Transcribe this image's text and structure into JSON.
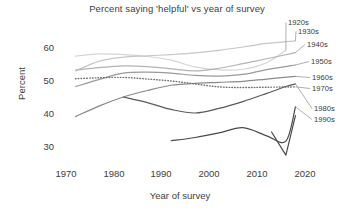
{
  "chart": {
    "title": "Percent saying 'helpful' vs year of survey",
    "xlabel": "Year of survey",
    "ylabel": "Percent"
  },
  "axes": {
    "yticks": [
      "60",
      "50",
      "40",
      "30"
    ],
    "xticks": [
      "1970",
      "1980",
      "1990",
      "2000",
      "2010",
      "2020"
    ]
  },
  "chart_data": {
    "type": "line",
    "title": "Percent saying 'helpful' vs year of survey",
    "xlabel": "Year of survey",
    "ylabel": "Percent",
    "xlim": [
      1968,
      2022
    ],
    "ylim": [
      26,
      63
    ],
    "grid": false,
    "legend": "right-inline-labels",
    "xticks": [
      1970,
      1980,
      1990,
      2000,
      2010,
      2020
    ],
    "yticks": [
      30,
      40,
      50,
      60
    ],
    "series": [
      {
        "name": "1920s",
        "color": "#d5d5d5",
        "style": "solid",
        "x": [
          1972,
          1977,
          1982,
          1987,
          1992,
          1997,
          2002,
          2007,
          2012,
          2016
        ],
        "values": [
          57.5,
          58.2,
          58.0,
          57.4,
          56.3,
          54.2,
          53.3,
          53.5,
          55.5,
          59.3
        ]
      },
      {
        "name": "1930s",
        "color": "#c6c6c6",
        "style": "solid",
        "x": [
          1972,
          1977,
          1982,
          1987,
          1992,
          1997,
          2002,
          2007,
          2012,
          2018
        ],
        "values": [
          53.0,
          56.0,
          57.2,
          57.6,
          58.0,
          58.5,
          59.3,
          60.3,
          61.4,
          62.2
        ]
      },
      {
        "name": "1940s",
        "color": "#b3b3b3",
        "style": "solid",
        "x": [
          1972,
          1977,
          1982,
          1987,
          1992,
          1997,
          2002,
          2007,
          2012,
          2018
        ],
        "values": [
          53.2,
          54.0,
          54.5,
          54.3,
          53.6,
          53.0,
          53.8,
          55.2,
          56.7,
          58.6
        ]
      },
      {
        "name": "1950s",
        "color": "#9a9a9a",
        "style": "solid",
        "x": [
          1972,
          1977,
          1982,
          1987,
          1992,
          1997,
          2002,
          2007,
          2012,
          2018
        ],
        "values": [
          48.2,
          50.4,
          52.3,
          52.6,
          52.3,
          51.6,
          51.4,
          51.9,
          53.4,
          54.8
        ]
      },
      {
        "name": "1960s",
        "color": "#8a8a8a",
        "style": "solid",
        "x": [
          1972,
          1977,
          1982,
          1987,
          1992,
          1997,
          2002,
          2007,
          2012,
          2018
        ],
        "values": [
          39.0,
          42.3,
          45.0,
          47.0,
          48.6,
          49.2,
          49.5,
          49.8,
          50.5,
          51.3
        ]
      },
      {
        "name": "1970s",
        "color": "#6f6f6f",
        "style": "dotted",
        "x": [
          1972,
          1977,
          1982,
          1987,
          1992,
          1997,
          2002,
          2007,
          2012,
          2018
        ],
        "values": [
          50.6,
          50.9,
          51.0,
          50.5,
          49.9,
          49.0,
          48.1,
          47.9,
          48.0,
          48.1
        ]
      },
      {
        "name": "1980s",
        "color": "#5a5a5a",
        "style": "solid",
        "x": [
          1982,
          1987,
          1992,
          1997,
          2002,
          2007,
          2012,
          2016,
          2018
        ],
        "values": [
          45.0,
          43.3,
          41.2,
          40.1,
          41.5,
          43.6,
          46.1,
          48.2,
          49.0
        ]
      },
      {
        "name": "1990s",
        "color": "#4a4a4a",
        "style": "solid",
        "x": [
          1992,
          1997,
          2002,
          2007,
          2012,
          2016,
          2018
        ],
        "values": [
          31.6,
          32.6,
          34.0,
          35.6,
          33.1,
          31.5,
          42.0
        ]
      },
      {
        "name": "1990s-tail",
        "color": "#4a4a4a",
        "style": "solid",
        "x": [
          2013,
          2016,
          2018
        ],
        "values": [
          34.3,
          27.2,
          39.3
        ]
      }
    ]
  },
  "labels": [
    {
      "text": "1920s",
      "x": 288,
      "y": 18
    },
    {
      "text": "1930s",
      "x": 298,
      "y": 27
    },
    {
      "text": "1940s",
      "x": 307,
      "y": 40
    },
    {
      "text": "1950s",
      "x": 311,
      "y": 57
    },
    {
      "text": "1960s",
      "x": 312,
      "y": 73
    },
    {
      "text": "1970s",
      "x": 312,
      "y": 84
    },
    {
      "text": "1980s",
      "x": 314,
      "y": 104
    },
    {
      "text": "1990s",
      "x": 314,
      "y": 115
    }
  ]
}
